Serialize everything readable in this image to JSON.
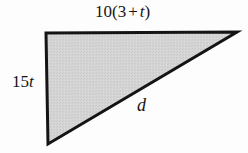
{
  "figure": {
    "kind": "right-triangle-diagram",
    "background_color": "#fdfdfd",
    "fill_color": "#d2d2d2",
    "stroke_color": "#141414",
    "stroke_width": 3,
    "vertices": {
      "top_left": [
        46,
        33
      ],
      "bottom_left": [
        48,
        144
      ],
      "right_apex": [
        237,
        32
      ]
    }
  },
  "labels": {
    "top": {
      "text": "10(3 + t)",
      "leading_number": "10",
      "open_paren": "(",
      "inner_number": "3",
      "operator": "+",
      "variable": "t",
      "close_paren": ")",
      "describes": "horizontal-top-edge"
    },
    "left": {
      "text": "15t",
      "coefficient": "15",
      "variable": "t",
      "describes": "vertical-left-leg"
    },
    "hypotenuse": {
      "text": "d",
      "variable": "d",
      "describes": "hypotenuse"
    }
  }
}
